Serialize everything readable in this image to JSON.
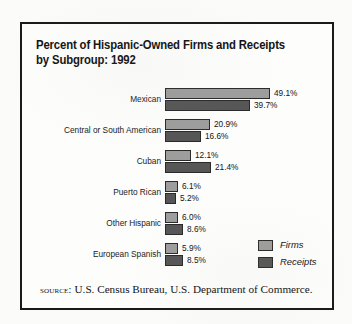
{
  "figure": {
    "title": "Percent of Hispanic-Owned Firms and Receipts by Subgroup: 1992",
    "source_label": "source:",
    "source_text": "U.S. Census Bureau, U.S. Department of Commerce."
  },
  "colors": {
    "firms": "#9d9d9d",
    "receipts": "#565656",
    "border": "#1a1a1a",
    "text": "#141414",
    "paper": "#fdfdfc"
  },
  "chart_data": {
    "type": "bar",
    "orientation": "horizontal",
    "title": "Percent of Hispanic-Owned Firms and Receipts by Subgroup: 1992",
    "xlabel": "",
    "ylabel": "",
    "grid": false,
    "legend_position": "right",
    "xlim": [
      0,
      49.1
    ],
    "value_suffix": "%",
    "categories": [
      "Mexican",
      "Central or South American",
      "Cuban",
      "Puerto Rican",
      "Other Hispanic",
      "European Spanish"
    ],
    "series": [
      {
        "name": "Firms",
        "values": [
          49.1,
          20.9,
          12.1,
          6.1,
          6.0,
          5.9
        ],
        "labels": [
          "49.1%",
          "20.9%",
          "12.1%",
          "6.1%",
          "6.0%",
          "5.9%"
        ]
      },
      {
        "name": "Receipts",
        "values": [
          39.7,
          16.6,
          21.4,
          5.2,
          8.6,
          8.5
        ],
        "labels": [
          "39.7%",
          "16.6%",
          "21.4%",
          "5.2%",
          "8.6%",
          "8.5%"
        ]
      }
    ]
  }
}
